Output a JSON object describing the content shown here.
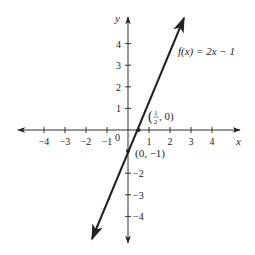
{
  "chart_data": {
    "type": "line",
    "title": "",
    "xlabel": "x",
    "ylabel": "y",
    "xlim": [
      -5,
      5
    ],
    "ylim": [
      -5,
      5
    ],
    "grid": false,
    "x_ticks": [
      -4,
      -3,
      -2,
      -1,
      1,
      2,
      3,
      4
    ],
    "y_ticks": [
      -4,
      -3,
      -2,
      1,
      2,
      3,
      4
    ],
    "x_tick_labels": [
      "−4",
      "−3",
      "−2",
      "−1",
      "1",
      "2",
      "3",
      "4"
    ],
    "y_tick_labels": [
      "−4",
      "−3",
      "−2",
      "1",
      "2",
      "3",
      "4"
    ],
    "origin_label": "0",
    "series": [
      {
        "name": "f(x) = 2x − 1",
        "equation": "f(x) = 2x - 1",
        "slope": 2,
        "intercept": -1,
        "x": [
          -1.75,
          2.7
        ],
        "y": [
          -4.5,
          4.4
        ],
        "color": "#222222"
      }
    ],
    "annotations": [
      {
        "label": "f(x) = 2x − 1",
        "position": "upper right of line"
      },
      {
        "label": "(½, 0)",
        "point": [
          0.5,
          0
        ],
        "type": "x-intercept"
      },
      {
        "label": "(0, −1)",
        "point": [
          0,
          -1
        ],
        "type": "y-intercept"
      }
    ]
  },
  "labels": {
    "x_axis": "x",
    "y_axis": "y",
    "origin": "0",
    "function": "f(x) = 2x − 1",
    "x_intercept_open": "(",
    "x_intercept_rest": ", 0)",
    "x_intercept_num": "1",
    "x_intercept_den": "2",
    "y_intercept": "(0, −1)"
  }
}
